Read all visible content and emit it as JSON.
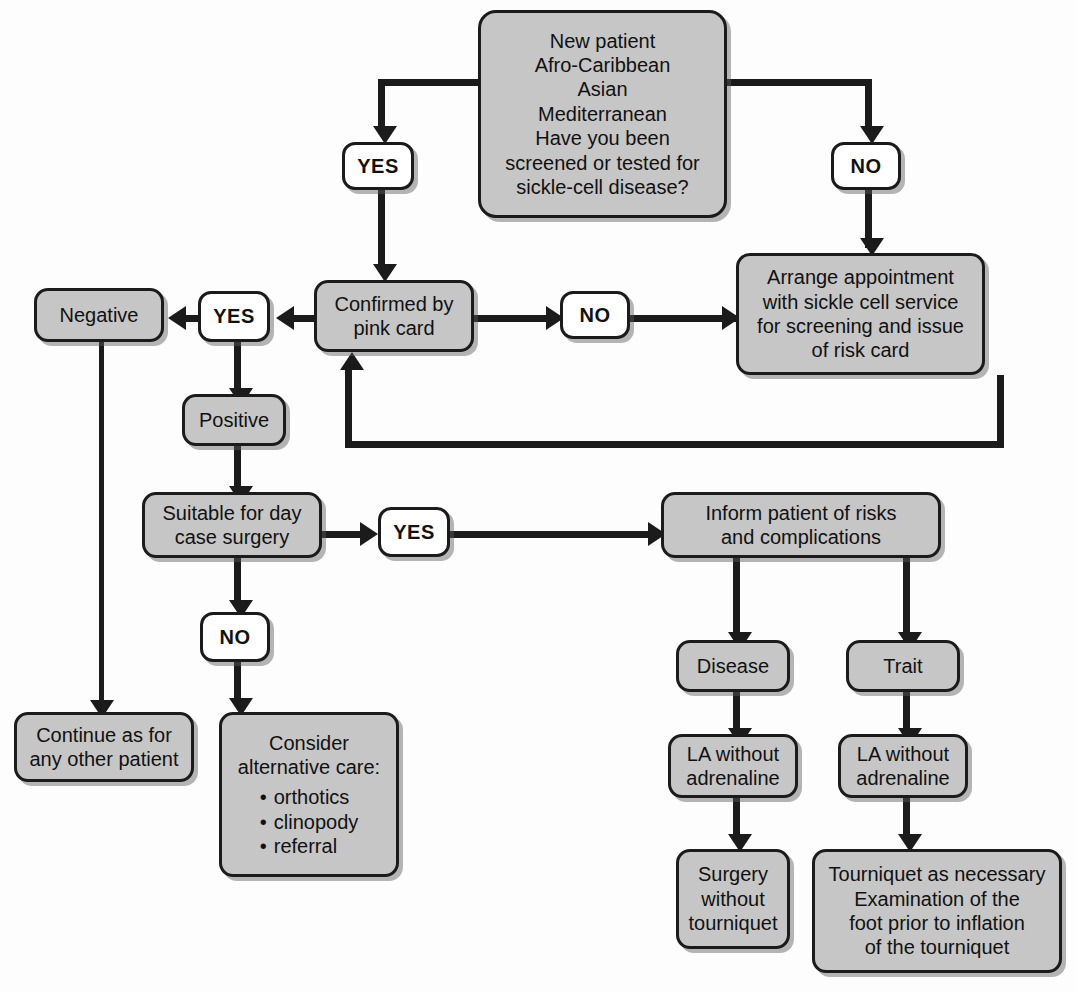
{
  "diagram": {
    "colors": {
      "node_fill": "#c6c6c6",
      "decision_fill": "#ffffff",
      "stroke": "#1b1b1b",
      "background": "#fdfdfd"
    },
    "nodes": {
      "new_patient": {
        "lines": [
          "New patient",
          "Afro-Caribbean",
          "Asian",
          "Mediterranean",
          "Have you been",
          "screened or tested for",
          "sickle-cell disease?"
        ]
      },
      "yes_top": {
        "label": "YES"
      },
      "no_top": {
        "label": "NO"
      },
      "confirmed_pink_card": {
        "lines": [
          "Confirmed by",
          "pink card"
        ]
      },
      "no_confirm": {
        "label": "NO"
      },
      "yes_confirm": {
        "label": "YES"
      },
      "arrange_appointment": {
        "lines": [
          "Arrange appointment",
          "with sickle cell service",
          "for screening and issue",
          "of risk card"
        ]
      },
      "negative": {
        "label": "Negative"
      },
      "positive": {
        "label": "Positive"
      },
      "suitable_day_case": {
        "lines": [
          "Suitable for day",
          "case surgery"
        ]
      },
      "yes_suitable": {
        "label": "YES"
      },
      "no_suitable": {
        "label": "NO"
      },
      "continue_patient": {
        "lines": [
          "Continue as for",
          "any other patient"
        ]
      },
      "consider_alternative": {
        "heading_lines": [
          "Consider",
          "alternative care:"
        ],
        "bullets": [
          "orthotics",
          "clinopody",
          "referral"
        ]
      },
      "inform_patient": {
        "lines": [
          "Inform patient of risks",
          "and complications"
        ]
      },
      "disease": {
        "label": "Disease"
      },
      "trait": {
        "label": "Trait"
      },
      "la_disease": {
        "lines": [
          "LA without",
          "adrenaline"
        ]
      },
      "la_trait": {
        "lines": [
          "LA without",
          "adrenaline"
        ]
      },
      "surgery_without_tourniquet": {
        "lines": [
          "Surgery",
          "without",
          "tourniquet"
        ]
      },
      "tourniquet_as_necessary": {
        "lines": [
          "Tourniquet as necessary",
          "Examination of the",
          "foot prior to inflation",
          "of the tourniquet"
        ]
      }
    }
  }
}
